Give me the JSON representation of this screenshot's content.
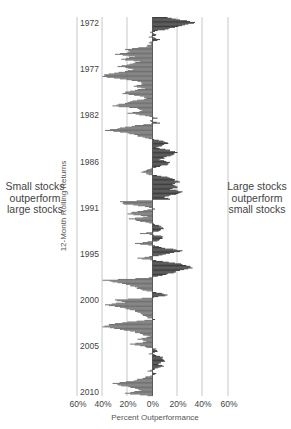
{
  "chart_data": {
    "type": "bar",
    "orientation": "horizontal",
    "title": "",
    "xlabel": "Percent Outperformance",
    "ylabel": "12-Month Rolling Returns",
    "xlim": [
      -60,
      60
    ],
    "x_ticks": [
      "60%",
      "40%",
      "20%",
      "0%",
      "20%",
      "40%",
      "60%"
    ],
    "year_labels": [
      "1972",
      "1977",
      "1982",
      "1986",
      "1991",
      "1995",
      "2000",
      "2005",
      "2010"
    ],
    "annotations": {
      "left": "Small stocks outperform large stocks",
      "right": "Large stocks outperform small stocks"
    },
    "colors": {
      "positive": "#3b3b3b",
      "negative": "#6e6e6e",
      "grid": "#c8c8c8"
    },
    "series_note": "Large-cap minus small-cap 12-month rolling return (%), approx. quarterly samples 1972–2010",
    "values": [
      12,
      22,
      34,
      26,
      18,
      10,
      -2,
      3,
      -3,
      6,
      -2,
      -1,
      -5,
      -22,
      -18,
      -30,
      -14,
      -25,
      -10,
      -18,
      -28,
      -15,
      -22,
      -35,
      -40,
      -26,
      -12,
      -8,
      -15,
      -6,
      -18,
      -24,
      -10,
      -5,
      -16,
      -22,
      -32,
      -12,
      -8,
      -20,
      -6,
      4,
      -2,
      6,
      -14,
      -26,
      -38,
      -20,
      -12,
      -6,
      5,
      12,
      8,
      3,
      14,
      20,
      16,
      9,
      5,
      14,
      12,
      3,
      -4,
      -9,
      -3,
      12,
      18,
      22,
      16,
      20,
      14,
      24,
      19,
      10,
      14,
      -26,
      -23,
      -6,
      2,
      -12,
      -20,
      -4,
      -19,
      -10,
      1,
      7,
      9,
      5,
      -10,
      7,
      8,
      4,
      -14,
      2,
      10,
      24,
      14,
      5,
      -12,
      3,
      18,
      27,
      32,
      22,
      17,
      8,
      -3,
      -40,
      -28,
      -18,
      -12,
      -8,
      3,
      12,
      1,
      -30,
      -22,
      -38,
      -26,
      -18,
      -12,
      -8,
      -4,
      2,
      -20,
      -35,
      -40,
      -26,
      -14,
      -8,
      -2,
      -12,
      -5,
      -18,
      -6,
      3,
      4,
      -3,
      6,
      8,
      10,
      5,
      9,
      2,
      -4,
      3,
      -2,
      -8,
      -15,
      -32,
      -25,
      -14,
      -9,
      -22,
      -4
    ]
  }
}
